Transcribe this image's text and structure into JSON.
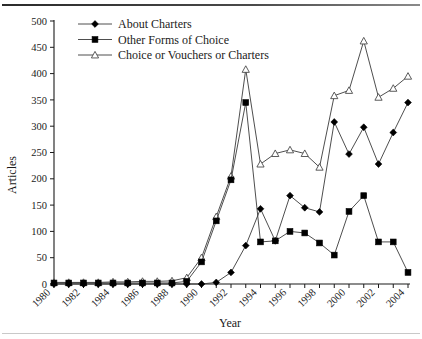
{
  "figure": {
    "background": "#ffffff",
    "ink": "#1a1a1a"
  },
  "axis": {
    "ylabel": "Articles",
    "xlabel": "Year"
  },
  "legend": {
    "items": [
      {
        "label": "About Charters",
        "marker": "filled-diamond-icon",
        "color": "#000000"
      },
      {
        "label": "Other Forms of Choice",
        "marker": "filled-square-icon",
        "color": "#000000"
      },
      {
        "label": "Choice or Vouchers or Charters",
        "marker": "open-triangle-icon",
        "color": "#ffffff"
      }
    ]
  },
  "chart_data": {
    "type": "line",
    "title": "",
    "subtitle": "",
    "xlabel": "Year",
    "ylabel": "Articles",
    "xlim": [
      1980,
      2004
    ],
    "ylim": [
      0,
      500
    ],
    "yticks": [
      0,
      50,
      100,
      150,
      200,
      250,
      300,
      350,
      400,
      450,
      500
    ],
    "xticks": [
      1980,
      1982,
      1984,
      1986,
      1988,
      1990,
      1992,
      1994,
      1996,
      1998,
      2000,
      2002,
      2004
    ],
    "xtick_labels": [
      "1980",
      "1982",
      "1984",
      "1986",
      "1988",
      "1990",
      "1992",
      "1994",
      "1996",
      "1998",
      "2000",
      "2002",
      "2004"
    ],
    "grid": false,
    "legend_position": "top-left",
    "x": [
      1980,
      1981,
      1982,
      1983,
      1984,
      1985,
      1986,
      1987,
      1988,
      1989,
      1990,
      1991,
      1992,
      1993,
      1994,
      1995,
      1996,
      1997,
      1998,
      1999,
      2000,
      2001,
      2002,
      2003,
      2004
    ],
    "series": [
      {
        "name": "About Charters",
        "marker": "filled-diamond",
        "values": [
          0,
          0,
          0,
          0,
          0,
          0,
          0,
          0,
          0,
          0,
          0,
          3,
          22,
          73,
          143,
          82,
          168,
          145,
          137,
          308,
          247,
          298,
          228,
          288,
          345
        ]
      },
      {
        "name": "Other Forms of Choice",
        "marker": "filled-square",
        "values": [
          2,
          2,
          2,
          2,
          2,
          2,
          2,
          2,
          2,
          5,
          42,
          120,
          198,
          345,
          80,
          82,
          100,
          97,
          78,
          55,
          138,
          168,
          80,
          80,
          22
        ]
      },
      {
        "name": "Choice or Vouchers or Charters",
        "marker": "open-triangle",
        "values": [
          3,
          3,
          3,
          3,
          4,
          4,
          5,
          5,
          6,
          12,
          50,
          128,
          205,
          408,
          228,
          248,
          255,
          248,
          222,
          358,
          368,
          462,
          355,
          372,
          395
        ]
      }
    ]
  },
  "series_tail": {
    "About Charters_2004": 318,
    "Other Forms of Choice_2004": 78,
    "Choice or Vouchers or Charters_2004": 395
  }
}
